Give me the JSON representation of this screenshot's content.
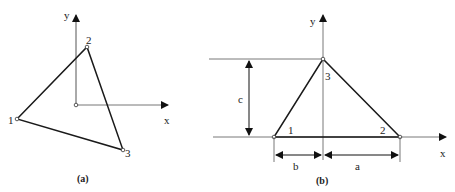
{
  "figure_a": {
    "caption": "(a)",
    "axes": {
      "x_label": "x",
      "y_label": "y"
    },
    "nodes": [
      {
        "id": "1",
        "label": "1"
      },
      {
        "id": "2",
        "label": "2"
      },
      {
        "id": "3",
        "label": "3"
      }
    ]
  },
  "figure_b": {
    "caption": "(b)",
    "axes": {
      "x_label": "x",
      "y_label": "y"
    },
    "nodes": [
      {
        "id": "1",
        "label": "1"
      },
      {
        "id": "2",
        "label": "2"
      },
      {
        "id": "3",
        "label": "3"
      }
    ],
    "dimensions": {
      "a": "a",
      "b": "b",
      "c": "c"
    }
  },
  "colors": {
    "line": "#1a1a1a",
    "axis": "#555555",
    "background": "#ffffff"
  }
}
